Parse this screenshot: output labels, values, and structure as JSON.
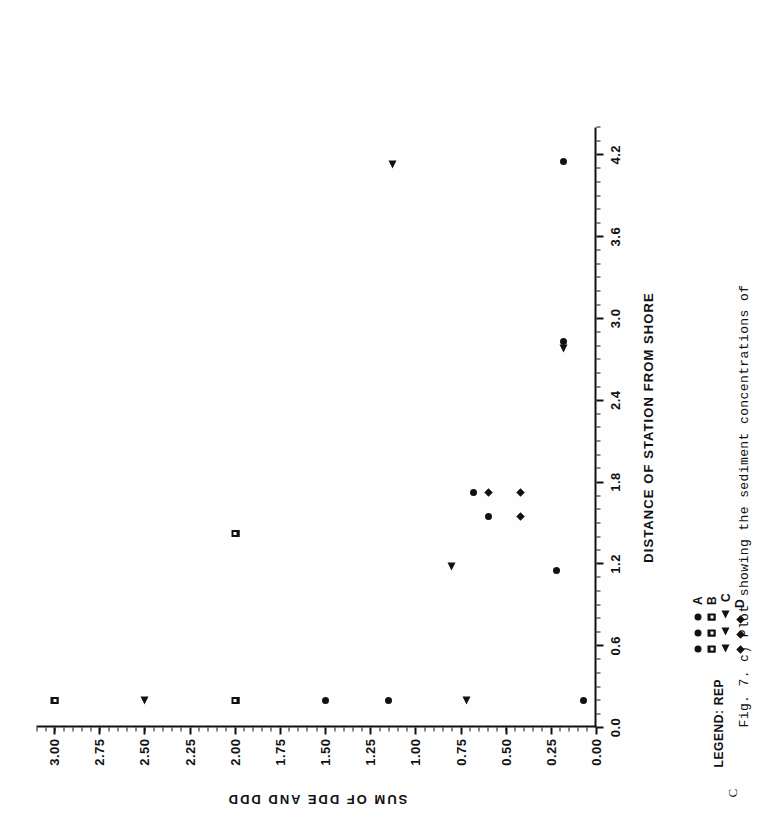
{
  "panel_letter": "C",
  "caption": "Fig. 7. c) Plot showing the sediment concentrations of",
  "chart_data": {
    "type": "scatter",
    "title": "",
    "xlabel": "DISTANCE OF STATION FROM SHORE",
    "ylabel": "SUM OF DDE AND DDD",
    "xlim": [
      0.0,
      4.4
    ],
    "ylim": [
      0.0,
      3.1
    ],
    "xticks": [
      "0.0",
      "0.6",
      "1.2",
      "1.8",
      "2.4",
      "3.0",
      "3.6",
      "4.2"
    ],
    "xtick_values": [
      0.0,
      0.6,
      1.2,
      1.8,
      2.4,
      3.0,
      3.6,
      4.2
    ],
    "yticks": [
      "0.00",
      "0.25",
      "0.50",
      "0.75",
      "1.00",
      "1.25",
      "1.50",
      "1.75",
      "2.00",
      "2.25",
      "2.50",
      "2.75",
      "3.00"
    ],
    "ytick_values": [
      0.0,
      0.25,
      0.5,
      0.75,
      1.0,
      1.25,
      1.5,
      1.75,
      2.0,
      2.25,
      2.5,
      2.75,
      3.0
    ],
    "grid": false,
    "legend_position": "below-axis",
    "legend_title": "LEGEND: REP",
    "series": [
      {
        "name": "A",
        "marker": "dot",
        "points": [
          {
            "x": 0.2,
            "y": 1.5
          },
          {
            "x": 0.2,
            "y": 1.15
          },
          {
            "x": 0.2,
            "y": 0.07
          },
          {
            "x": 1.15,
            "y": 0.22
          },
          {
            "x": 1.55,
            "y": 0.6
          },
          {
            "x": 1.72,
            "y": 0.68
          },
          {
            "x": 2.83,
            "y": 0.18
          },
          {
            "x": 4.15,
            "y": 0.18
          }
        ]
      },
      {
        "name": "B",
        "marker": "square",
        "points": [
          {
            "x": 0.2,
            "y": 3.0
          },
          {
            "x": 0.2,
            "y": 2.0
          },
          {
            "x": 1.42,
            "y": 2.0
          }
        ]
      },
      {
        "name": "C",
        "marker": "triangle",
        "points": [
          {
            "x": 0.2,
            "y": 2.5
          },
          {
            "x": 0.2,
            "y": 0.72
          },
          {
            "x": 1.18,
            "y": 0.8
          },
          {
            "x": 2.78,
            "y": 0.18
          },
          {
            "x": 4.13,
            "y": 1.13
          }
        ]
      },
      {
        "name": "D",
        "marker": "diamond",
        "points": [
          {
            "x": 1.55,
            "y": 0.42
          },
          {
            "x": 1.72,
            "y": 0.42
          },
          {
            "x": 1.72,
            "y": 0.6
          }
        ]
      }
    ]
  }
}
